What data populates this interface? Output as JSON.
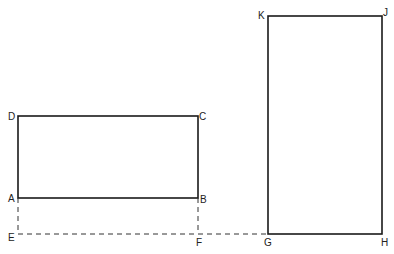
{
  "diagram": {
    "colors": {
      "line": "#1a1a1a",
      "background": "#ffffff"
    },
    "rect_abcd": {
      "corners": {
        "A": [
          18,
          198
        ],
        "B": [
          198,
          198
        ],
        "C": [
          198,
          116
        ],
        "D": [
          18,
          116
        ]
      }
    },
    "rect_ghjk": {
      "corners": {
        "G": [
          268,
          234
        ],
        "H": [
          382,
          234
        ],
        "J": [
          382,
          16
        ],
        "K": [
          268,
          16
        ]
      }
    },
    "dashed_lines": [
      {
        "from": "A",
        "to": "E"
      },
      {
        "from": "B",
        "to": "F"
      },
      {
        "from": "E",
        "to": "G"
      }
    ],
    "labels": {
      "A": "A",
      "B": "B",
      "C": "C",
      "D": "D",
      "E": "E",
      "F": "F",
      "G": "G",
      "H": "H",
      "J": "J",
      "K": "K"
    }
  }
}
